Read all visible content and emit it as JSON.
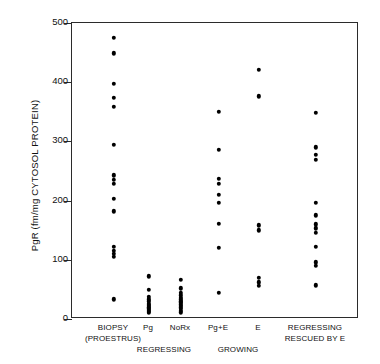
{
  "chart_data": {
    "type": "scatter",
    "title": "",
    "xlabel": "",
    "ylabel": "PgR (fm/mg CYTOSOL PROTEIN)",
    "ylim": [
      0,
      500
    ],
    "yticks": [
      0,
      100,
      200,
      300,
      400,
      500
    ],
    "ytick_labels": [
      "0",
      "100",
      "200",
      "300",
      "400",
      "500"
    ],
    "grid": false,
    "legend": "none",
    "categories": [
      "BIOPSY (PROESTRUS)",
      "Pg",
      "NoRx",
      "Pg+E",
      "E",
      "REGRESSING RESCUED BY E"
    ],
    "groups": [
      {
        "name": "BIOPSY (PROESTRUS)",
        "line1": "BIOPSY",
        "line2": "(PROESTRUS)",
        "x_center_px": 113,
        "values": [
          475,
          449,
          397,
          374,
          358,
          294,
          243,
          235,
          228,
          203,
          182,
          122,
          115,
          110,
          105,
          33
        ]
      },
      {
        "name": "Pg",
        "line1": "Pg",
        "line2": "",
        "x_center_px": 148,
        "values": [
          72,
          49,
          38,
          33,
          30,
          26,
          24,
          22,
          20,
          18,
          16,
          14,
          12,
          10
        ]
      },
      {
        "name": "NoRx",
        "line1": "NoRx",
        "line2": "",
        "x_center_px": 180,
        "values": [
          66,
          52,
          44,
          40,
          36,
          33,
          30,
          28,
          25,
          22,
          20,
          17,
          14,
          11
        ]
      },
      {
        "name": "Pg+E",
        "line1": "Pg+E",
        "line2": "",
        "x_center_px": 218,
        "values": [
          350,
          286,
          237,
          228,
          210,
          196,
          161,
          120,
          44
        ]
      },
      {
        "name": "E",
        "line1": "E",
        "line2": "",
        "x_center_px": 258,
        "values": [
          421,
          376,
          158,
          150,
          70,
          62,
          56
        ]
      },
      {
        "name": "REGRESSING RESCUED BY E",
        "line1": "REGRESSING",
        "line2": "RESCUED BY E",
        "x_center_px": 315,
        "values": [
          348,
          290,
          277,
          269,
          196,
          175,
          160,
          153,
          146,
          122,
          96,
          90,
          57
        ]
      }
    ],
    "x_group_labels_secondary": [
      {
        "text": "REGRESSING",
        "x_center_px": 164,
        "y_px": 344
      },
      {
        "text": "GROWING",
        "x_center_px": 238,
        "y_px": 344
      }
    ],
    "marker": {
      "shape": "circle",
      "color": "#000000",
      "size_px": 4.4
    },
    "axis_color": "#2b2b2b",
    "background": "#ffffff"
  }
}
